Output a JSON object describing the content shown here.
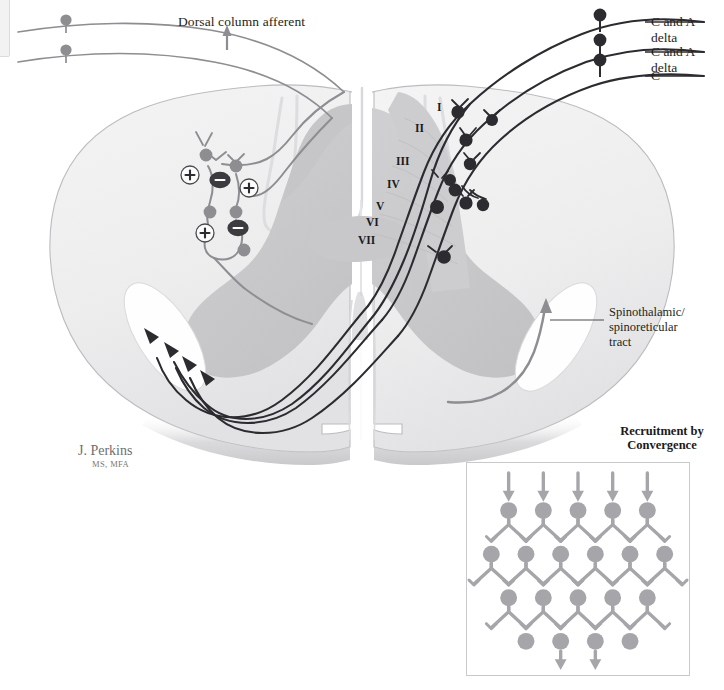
{
  "figure": {
    "title_inset": "Recruitment by\nConvergence",
    "inset_title_line1": "Recruitment by",
    "inset_title_line2": "Convergence",
    "labels": {
      "dorsal_column_afferent": "Dorsal column afferent",
      "fiber_top": "C and A delta",
      "fiber_middle": "C and A delta",
      "fiber_bottom": "C",
      "tract_line1": "Spinothalamic/",
      "tract_line2": "spinoreticular",
      "tract_line3": "tract"
    },
    "laminae": [
      {
        "numeral": "I",
        "x": 437,
        "y": 101
      },
      {
        "numeral": "II",
        "x": 415,
        "y": 122
      },
      {
        "numeral": "III",
        "x": 396,
        "y": 155
      },
      {
        "numeral": "IV",
        "x": 387,
        "y": 178
      },
      {
        "numeral": "V",
        "x": 376,
        "y": 200
      },
      {
        "numeral": "VI",
        "x": 366,
        "y": 216
      },
      {
        "numeral": "VII",
        "x": 358,
        "y": 234
      }
    ],
    "synapse_signs": [
      {
        "sign": "+",
        "x": 190,
        "y": 175
      },
      {
        "sign": "−",
        "x": 220,
        "y": 180
      },
      {
        "sign": "+",
        "x": 249,
        "y": 188
      },
      {
        "sign": "+",
        "x": 205,
        "y": 233
      },
      {
        "sign": "−",
        "x": 238,
        "y": 228
      }
    ],
    "credit": {
      "name": "J. Perkins",
      "credentials": "MS, MFA"
    },
    "colors": {
      "white_matter": "#ececed",
      "gray_matter": "#c9c9cb",
      "gray_matter_light": "#d6d6d8",
      "outline": "#b5b5b8",
      "dark_fiber": "#2b2b30",
      "gray_fiber": "#8d8d92",
      "inset_gray": "#a6a6aa",
      "text": "#231f20",
      "shadow": "#d8d8da"
    },
    "inset_network": {
      "rows": [
        {
          "count": 5,
          "has_input_arrows": true
        },
        {
          "count": 6,
          "has_input_arrows": false
        },
        {
          "count": 5,
          "has_input_arrows": false
        },
        {
          "count": 4,
          "has_input_arrows": false
        }
      ],
      "output_arrows": 2
    }
  }
}
